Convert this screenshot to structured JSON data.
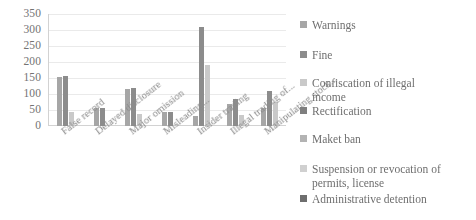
{
  "chart_data": {
    "type": "bar",
    "title": "",
    "xlabel": "",
    "ylabel": "",
    "ylim": [
      0,
      350
    ],
    "ytick_step": 50,
    "yticks": [
      350,
      300,
      250,
      200,
      150,
      100,
      50,
      0
    ],
    "grid": true,
    "legend_position": "right",
    "categories": [
      "False record",
      "Delayed disclosure",
      "Major omission",
      "Misleading...",
      "Insider trading",
      "Illegal trading of...",
      "Manipulating stock..."
    ],
    "series": [
      {
        "name": "Warnings",
        "color": "#a6a6a6",
        "values": [
          152,
          55,
          115,
          45,
          30,
          70,
          55
        ]
      },
      {
        "name": "Fine",
        "color": "#8c8c8c",
        "values": [
          155,
          55,
          118,
          45,
          308,
          85,
          110
        ]
      },
      {
        "name": "Confiscation of illegal\nincome",
        "color": "#c9c9c9",
        "values": [
          45,
          0,
          38,
          0,
          190,
          35,
          75
        ]
      },
      {
        "name": "Rectification",
        "color": "#7f7f7f",
        "values": [
          0,
          0,
          0,
          0,
          0,
          0,
          0
        ]
      },
      {
        "name": "Maket ban",
        "color": "#b3b3b3",
        "values": [
          0,
          0,
          0,
          0,
          0,
          0,
          0
        ]
      },
      {
        "name": "Suspension or revocation of\npermits, license",
        "color": "#d0d0d0",
        "values": [
          0,
          0,
          0,
          0,
          0,
          0,
          0
        ]
      },
      {
        "name": "Administrative detention",
        "color": "#6e6e6e",
        "values": [
          0,
          0,
          0,
          0,
          0,
          0,
          0
        ]
      }
    ]
  },
  "legend": {
    "items": [
      {
        "label": "Warnings",
        "color": "#a6a6a6"
      },
      {
        "label": "Fine",
        "color": "#8c8c8c"
      },
      {
        "label": "Confiscation of illegal\nincome",
        "color": "#c9c9c9"
      },
      {
        "label": "Rectification",
        "color": "#7f7f7f"
      },
      {
        "label": "Maket ban",
        "color": "#b3b3b3"
      },
      {
        "label": "Suspension or revocation of\npermits, license",
        "color": "#d0d0d0"
      },
      {
        "label": "Administrative detention",
        "color": "#6e6e6e"
      }
    ]
  }
}
